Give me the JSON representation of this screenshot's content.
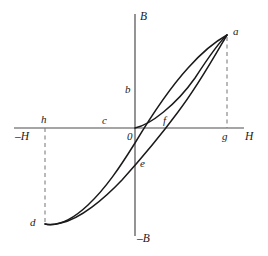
{
  "figure": {
    "kind": "magnetic-hysteresis-loop",
    "width": 268,
    "height": 256,
    "background": "#ffffff",
    "stroke_color": "#1a1a1a",
    "axis_color": "#4d4d4d",
    "dash_color": "#808080"
  },
  "axes": {
    "origin": {
      "x": 135,
      "y": 128
    },
    "vertical": {
      "x": 135,
      "y_top": 14,
      "y_bottom": 236
    },
    "horizontal": {
      "y": 128,
      "x_left": 14,
      "x_right": 244
    },
    "labels": {
      "b_positive": "B",
      "b_negative": "–B",
      "h_positive": "H",
      "h_negative": "–H",
      "origin": "0"
    }
  },
  "points": [
    {
      "id": "a",
      "label": "a",
      "x": 227,
      "y": 34,
      "label_x": 233,
      "label_y": 28,
      "role": "positive-saturation"
    },
    {
      "id": "b",
      "label": "b",
      "x": 135,
      "y": 92,
      "label_x": 126,
      "label_y": 86,
      "role": "positive-remanence"
    },
    {
      "id": "c",
      "label": "c",
      "x": 112,
      "y": 128,
      "label_x": 103,
      "label_y": 117,
      "role": "negative-coercivity"
    },
    {
      "id": "d",
      "label": "d",
      "x": 45,
      "y": 224,
      "label_x": 31,
      "label_y": 219,
      "role": "negative-saturation"
    },
    {
      "id": "e",
      "label": "e",
      "x": 135,
      "y": 164,
      "label_x": 140,
      "label_y": 160,
      "role": "negative-remanence"
    },
    {
      "id": "f",
      "label": "f",
      "x": 159,
      "y": 128,
      "label_x": 163,
      "label_y": 117,
      "role": "positive-coercivity"
    },
    {
      "id": "g",
      "label": "g",
      "x": 227,
      "y": 128,
      "label_x": 222,
      "label_y": 131,
      "role": "positive-field-max"
    },
    {
      "id": "h",
      "label": "h",
      "x": 45,
      "y": 128,
      "label_x": 41,
      "label_y": 116,
      "role": "negative-field-max"
    }
  ],
  "curves": [
    {
      "name": "initial-magnetization-curve",
      "from": "0",
      "to": "a",
      "path": "M 135 128 C 150 125 176 105 195 78 C 208 58 219 42 227 35"
    },
    {
      "name": "descending-branch-a-to-d",
      "from": "a",
      "through": [
        "e",
        "f"
      ],
      "to": "d",
      "path": "M 227 35 C 217 52 198 86 178 112 C 158 139 140 160 122 180 C 104 199 80 219 61 223 C 54 225 48 225 45 224"
    },
    {
      "name": "ascending-branch-d-to-a",
      "from": "d",
      "through": [
        "c",
        "b"
      ],
      "to": "a",
      "path": "M 45 224 C 55 226 70 222 88 205 C 106 188 120 167 135 143 C 150 118 168 90 188 68 C 204 50 218 40 227 35"
    }
  ],
  "dashed_guides": [
    {
      "name": "guide-a-to-g",
      "x1": 227,
      "y1": 37,
      "x2": 227,
      "y2": 128
    },
    {
      "name": "guide-h-to-d",
      "x1": 45,
      "y1": 128,
      "x2": 45,
      "y2": 222
    }
  ]
}
